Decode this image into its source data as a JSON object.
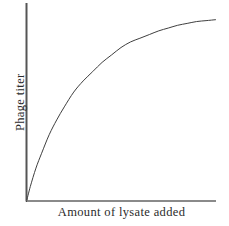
{
  "figure": {
    "background_color": "#ffffff",
    "width": 229,
    "height": 226
  },
  "chart_data": {
    "type": "line",
    "title": "",
    "subtitle": "",
    "xlabel": "Amount of lysate added",
    "ylabel": "Phage titer",
    "grid": false,
    "legend": null,
    "legend_position": "none",
    "axis_color": "#555555",
    "line_color": "#3f3f3f",
    "line_width": 1,
    "xlim": [
      0,
      100
    ],
    "ylim": [
      0,
      100
    ],
    "x_tick_labels": [],
    "y_tick_labels": [],
    "annotations": [],
    "series": [
      {
        "name": "phage titer response",
        "shape": "saturating rise to plateau",
        "x": [
          0,
          2,
          5,
          8,
          12,
          16,
          20,
          25,
          30,
          35,
          40,
          45,
          50,
          55,
          60,
          65,
          70,
          75,
          80,
          85,
          90,
          95,
          100
        ],
        "y": [
          0,
          8,
          18,
          26,
          36,
          44,
          51,
          59,
          65,
          70,
          75,
          79,
          83,
          86,
          88,
          90,
          92,
          93.5,
          95,
          96,
          97,
          97.5,
          98
        ]
      }
    ]
  },
  "axes": {
    "y_axis_name": "y-axis-line",
    "x_axis_name": "x-axis-line"
  }
}
